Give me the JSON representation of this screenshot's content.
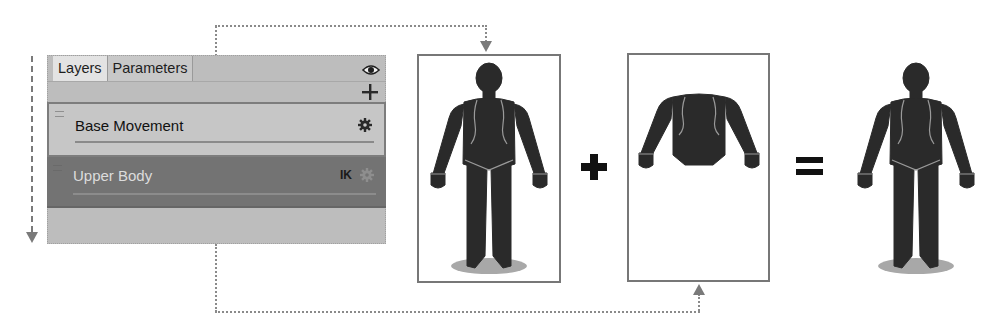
{
  "panel": {
    "tabs": [
      {
        "label": "Layers",
        "active": true
      },
      {
        "label": "Parameters",
        "active": false
      }
    ],
    "icons": {
      "visibility": "eye-icon",
      "add": "plus-icon"
    },
    "add_label": "+",
    "layers": [
      {
        "name": "Base Movement",
        "selected": true,
        "badge": "",
        "icon": "gear-icon"
      },
      {
        "name": "Upper Body",
        "selected": false,
        "badge": "IK",
        "icon": "gear-icon"
      }
    ]
  },
  "diagram": {
    "operators": {
      "plus": "+",
      "equals": "="
    },
    "figures": [
      {
        "id": "base-movement-figure",
        "content": "full body with ground shadow"
      },
      {
        "id": "upper-body-figure",
        "content": "upper body only (arms and torso)"
      },
      {
        "id": "combined-result-figure",
        "content": "full body combined result"
      }
    ],
    "colors": {
      "silhouette": "#2a2a2a",
      "outline": "#9a9a9a",
      "shadow": "#a8a8a8",
      "box_border": "#777777",
      "panel_bg": "#bdbdbd",
      "selected_row": "#c6c6c6",
      "unselected_row": "#737373",
      "connector": "#8a8a8a"
    }
  }
}
